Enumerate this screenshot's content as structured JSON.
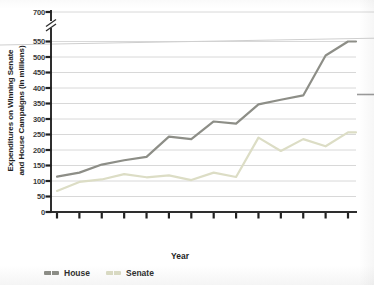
{
  "figure": {
    "y_axis": {
      "title_line1": "Expenditures on Winning Senate",
      "title_line2": "and House Campaigns (in millions)",
      "has_axis_break": true,
      "break_between": [
        550,
        700
      ]
    },
    "x_axis": {
      "title": "Year"
    },
    "legend": {
      "items": [
        {
          "label": "House",
          "color": "#8d8e87"
        },
        {
          "label": "Senate",
          "color": "#dcddc5"
        }
      ]
    }
  },
  "chart_data": {
    "type": "line",
    "title": "",
    "xlabel": "Year",
    "ylabel": "Expenditures on Winning Senate and House Campaigns (in millions)",
    "x": [
      1982,
      1984,
      1986,
      1988,
      1990,
      1992,
      1994,
      1996,
      1998,
      2000,
      2002,
      2004,
      2006,
      2008
    ],
    "series": [
      {
        "name": "House",
        "color": "#8d8e87",
        "values": [
          114,
          127,
          153,
          167,
          178,
          243,
          235,
          292,
          285,
          347,
          362,
          376,
          505,
          550
        ]
      },
      {
        "name": "Senate",
        "color": "#dcddc5",
        "values": [
          68,
          97,
          105,
          122,
          112,
          118,
          103,
          127,
          113,
          240,
          197,
          235,
          212,
          257
        ]
      }
    ],
    "y_ticks": [
      0,
      50,
      100,
      150,
      200,
      250,
      300,
      350,
      400,
      450,
      500,
      550,
      700
    ],
    "axis_break_between": [
      550,
      700
    ],
    "grid": true,
    "legend_position": "bottom-left",
    "colors": {
      "grid": "#d8d8d8",
      "axis": "#2e2e2e",
      "tick_text": "#3a3a3a",
      "artifact": "#cfcfcf"
    }
  }
}
